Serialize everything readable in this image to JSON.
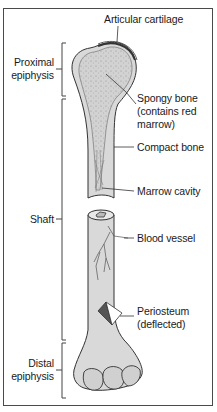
{
  "diagram": {
    "labels": {
      "articular_cartilage": "Articular cartilage",
      "proximal_epiphysis_line1": "Proximal",
      "proximal_epiphysis_line2": "epiphysis",
      "spongy_bone_line1": "Spongy bone",
      "spongy_bone_line2": "(contains red",
      "spongy_bone_line3": "marrow)",
      "compact_bone": "Compact bone",
      "marrow_cavity": "Marrow cavity",
      "shaft": "Shaft",
      "blood_vessel": "Blood vessel",
      "periosteum_line1": "Periosteum",
      "periosteum_line2": "(deflected)",
      "distal_epiphysis_line1": "Distal",
      "distal_epiphysis_line2": "epiphysis"
    },
    "regions": [
      "Proximal epiphysis",
      "Shaft",
      "Distal epiphysis"
    ],
    "colors": {
      "bone_fill": "#d9d9d9",
      "spongy_fill": "#cfcfcf",
      "outline": "#333333",
      "periosteum_dark": "#555555",
      "periosteum_light": "#ffffff",
      "frame": "#4a4a4a"
    }
  }
}
